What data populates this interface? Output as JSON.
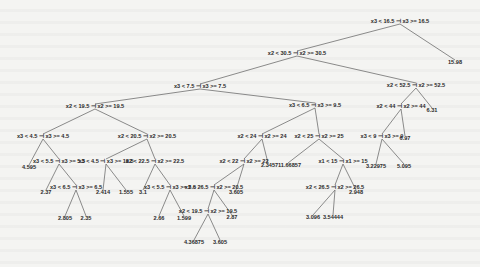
{
  "tree": {
    "title": "Regression tree",
    "nodes": [
      {
        "id": "n0",
        "label": "x3 < 16.5 ⊣ x3 >= 16.5",
        "x": 400,
        "y": 23
      },
      {
        "id": "n1",
        "label": "x2 < 30.5 ⊣ x2 >= 30.5",
        "x": 297,
        "y": 55
      },
      {
        "id": "l0",
        "label": "15.98",
        "x": 455,
        "y": 64
      },
      {
        "id": "n2",
        "label": "x3 < 7.5 ⊣ x3 >= 7.5",
        "x": 200,
        "y": 88
      },
      {
        "id": "n3",
        "label": "x2 < 52.5 ⊣ x2 >= 52.5",
        "x": 416,
        "y": 87
      },
      {
        "id": "n4",
        "label": "x2 < 19.5 ⊣ x2 >= 19.5",
        "x": 95,
        "y": 108
      },
      {
        "id": "n5",
        "label": "x3 < 6.5 ⊣ x3 >= 9.5",
        "x": 315,
        "y": 107
      },
      {
        "id": "n6",
        "label": "x2 < 44 ⊣ x2 >= 44",
        "x": 401,
        "y": 108
      },
      {
        "id": "l1",
        "label": "6.31",
        "x": 432,
        "y": 112
      },
      {
        "id": "n7",
        "label": "x3 < 4.5 ⊣ x3 >= 4.5",
        "x": 43,
        "y": 138
      },
      {
        "id": "n8",
        "label": "x2 < 20.5 ⊣ x2 >= 20.5",
        "x": 147,
        "y": 138
      },
      {
        "id": "n9",
        "label": "x2 < 24 ⊣ x2 >= 24",
        "x": 262,
        "y": 138
      },
      {
        "id": "n10",
        "label": "x2 < 25 ⊣ x2 >= 25",
        "x": 319,
        "y": 138
      },
      {
        "id": "n11",
        "label": "x3 < 9 ⊣ x3 >= 9",
        "x": 382,
        "y": 138
      },
      {
        "id": "l2",
        "label": "6.97",
        "x": 405,
        "y": 140
      },
      {
        "id": "l3",
        "label": "4.595",
        "x": 29,
        "y": 169
      },
      {
        "id": "n12",
        "label": "x3 < 5.5 ⊣ x3 >= 5.5",
        "x": 59,
        "y": 163
      },
      {
        "id": "n13",
        "label": "x3 < 4.5 ⊣ x3 >= 18.5",
        "x": 106,
        "y": 163
      },
      {
        "id": "n14",
        "label": "x2 < 22.5 ⊣ x2 >= 22.5",
        "x": 155,
        "y": 163
      },
      {
        "id": "n15",
        "label": "x2 < 22 ⊣ x2 >= 22",
        "x": 244,
        "y": 163
      },
      {
        "id": "l4",
        "label": "2.345",
        "x": 268,
        "y": 167
      },
      {
        "id": "l5",
        "label": "711.66857",
        "x": 288,
        "y": 167
      },
      {
        "id": "n16",
        "label": "x1 < 15 ⊣ x1 >= 15",
        "x": 343,
        "y": 163
      },
      {
        "id": "l6",
        "label": "3.22975",
        "x": 376,
        "y": 168
      },
      {
        "id": "l7",
        "label": "5.095",
        "x": 404,
        "y": 168
      },
      {
        "id": "l8",
        "label": "2.37",
        "x": 46,
        "y": 194
      },
      {
        "id": "n17",
        "label": "x3 < 6.5 ⊣ x3 >= 6.5",
        "x": 76,
        "y": 189
      },
      {
        "id": "l9",
        "label": "2.414",
        "x": 103,
        "y": 194
      },
      {
        "id": "l10",
        "label": "1.555",
        "x": 126,
        "y": 194
      },
      {
        "id": "l11",
        "label": "3.1",
        "x": 143,
        "y": 194
      },
      {
        "id": "n18",
        "label": "x3 < 5.5 ⊣ x3 >= 5.5",
        "x": 170,
        "y": 189
      },
      {
        "id": "n19",
        "label": "x2 < 26.5 ⊣ x2 >= 20.5",
        "x": 214,
        "y": 189
      },
      {
        "id": "l12",
        "label": "3.605",
        "x": 236,
        "y": 194
      },
      {
        "id": "n20",
        "label": "x2 < 26.5 ⊣ x2 >= 26.5",
        "x": 335,
        "y": 189
      },
      {
        "id": "l13",
        "label": "2.948",
        "x": 356,
        "y": 194
      },
      {
        "id": "l14",
        "label": "2.805",
        "x": 65,
        "y": 220
      },
      {
        "id": "l15",
        "label": "2.35",
        "x": 86,
        "y": 220
      },
      {
        "id": "l16",
        "label": "2.66",
        "x": 159,
        "y": 220
      },
      {
        "id": "l17",
        "label": "1.599",
        "x": 184,
        "y": 220
      },
      {
        "id": "n21",
        "label": "x2 < 19.5 ⊣ x2 >= 19.5",
        "x": 208,
        "y": 213
      },
      {
        "id": "l18",
        "label": "2.87",
        "x": 232,
        "y": 219
      },
      {
        "id": "l19",
        "label": "3.096",
        "x": 313,
        "y": 219
      },
      {
        "id": "l20",
        "label": "3.54444",
        "x": 333,
        "y": 219
      },
      {
        "id": "l21",
        "label": "4.36875",
        "x": 194,
        "y": 244
      },
      {
        "id": "l22",
        "label": "3.605",
        "x": 220,
        "y": 244
      }
    ],
    "edges": [
      [
        "n0",
        "n1"
      ],
      [
        "n0",
        "l0"
      ],
      [
        "n1",
        "n2"
      ],
      [
        "n1",
        "n3"
      ],
      [
        "n2",
        "n4"
      ],
      [
        "n2",
        "n5"
      ],
      [
        "n3",
        "n6"
      ],
      [
        "n3",
        "l1"
      ],
      [
        "n4",
        "n7"
      ],
      [
        "n4",
        "n8"
      ],
      [
        "n5",
        "n9"
      ],
      [
        "n5",
        "n10"
      ],
      [
        "n6",
        "n11"
      ],
      [
        "n6",
        "l2"
      ],
      [
        "n7",
        "l3"
      ],
      [
        "n7",
        "n12"
      ],
      [
        "n8",
        "n13"
      ],
      [
        "n8",
        "n14"
      ],
      [
        "n9",
        "n15"
      ],
      [
        "n9",
        "l4"
      ],
      [
        "n10",
        "l5"
      ],
      [
        "n10",
        "n16"
      ],
      [
        "n11",
        "l6"
      ],
      [
        "n11",
        "l7"
      ],
      [
        "n12",
        "l8"
      ],
      [
        "n12",
        "n17"
      ],
      [
        "n13",
        "l9"
      ],
      [
        "n13",
        "l10"
      ],
      [
        "n14",
        "l11"
      ],
      [
        "n14",
        "n18"
      ],
      [
        "n15",
        "n19"
      ],
      [
        "n15",
        "l12"
      ],
      [
        "n16",
        "n20"
      ],
      [
        "n16",
        "l13"
      ],
      [
        "n17",
        "l14"
      ],
      [
        "n17",
        "l15"
      ],
      [
        "n18",
        "l16"
      ],
      [
        "n18",
        "l17"
      ],
      [
        "n19",
        "n21"
      ],
      [
        "n19",
        "l18"
      ],
      [
        "n20",
        "l19"
      ],
      [
        "n20",
        "l20"
      ],
      [
        "n21",
        "l21"
      ],
      [
        "n21",
        "l22"
      ]
    ]
  }
}
